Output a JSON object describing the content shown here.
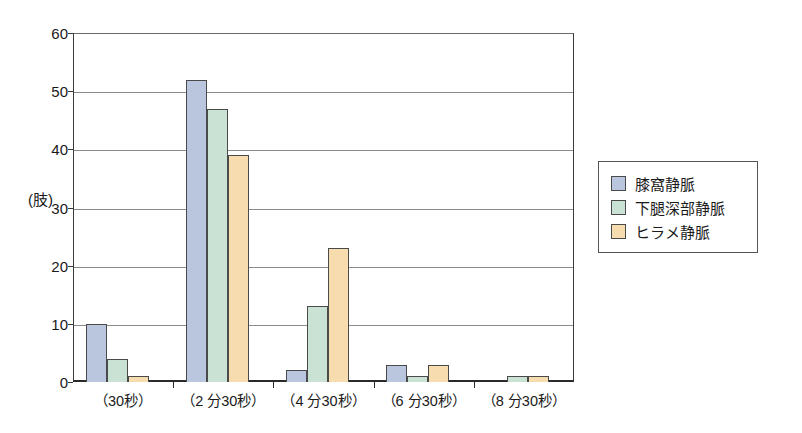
{
  "chart_data": {
    "type": "bar",
    "title": "",
    "subtitle": "",
    "xlabel": "",
    "ylabel": "(肢)",
    "ylim": [
      0,
      60
    ],
    "ytick_values": [
      0,
      10,
      20,
      30,
      40,
      50,
      60
    ],
    "ytick_labels": [
      "0",
      "10",
      "20",
      "30",
      "40",
      "50",
      "60"
    ],
    "grid": true,
    "grid_axis": "y",
    "legend_position": "right",
    "categories": [
      "（30秒）",
      "（2 分30秒）",
      "（4 分30秒）",
      "（6 分30秒）",
      "（8 分30秒）"
    ],
    "series": [
      {
        "name": "膝窩静脈",
        "color": "#b9c6dd",
        "values": [
          10,
          52,
          2,
          3,
          0
        ]
      },
      {
        "name": "下腿深部静脈",
        "color": "#c9e2d3",
        "values": [
          4,
          47,
          13,
          1,
          1
        ]
      },
      {
        "name": "ヒラメ静脈",
        "color": "#f6dcae",
        "values": [
          1,
          39,
          23,
          3,
          1
        ]
      }
    ]
  },
  "colors": {
    "series_1": "#b9c6dd",
    "series_2": "#c9e2d3",
    "series_3": "#f6dcae",
    "bar_outline": "#4a4a4a",
    "axis": "#2a2a2a",
    "gridline": "#8a8a8a",
    "background": "#ffffff",
    "text": "#1a1a1a"
  }
}
